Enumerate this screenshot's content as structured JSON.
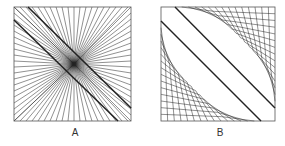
{
  "panels": [
    {
      "label": "A",
      "box": {
        "x": 14,
        "y": 7,
        "w": 117,
        "h": 114
      },
      "band": {
        "line1": [
          28,
          7,
          131,
          108
        ],
        "line2": [
          14,
          20,
          118,
          121
        ]
      },
      "center": [
        74,
        64
      ],
      "ray_step": 6,
      "style": "radial-fan"
    },
    {
      "label": "B",
      "box": {
        "x": 161,
        "y": 7,
        "w": 114,
        "h": 114
      },
      "band": {
        "line1": [
          175,
          7,
          275,
          108
        ],
        "line2": [
          161,
          21,
          261,
          121
        ]
      },
      "chevron_count": 14,
      "style": "nested-chevrons"
    }
  ],
  "colors": {
    "stroke": "#222222",
    "box": "#555555",
    "background": "#ffffff"
  }
}
